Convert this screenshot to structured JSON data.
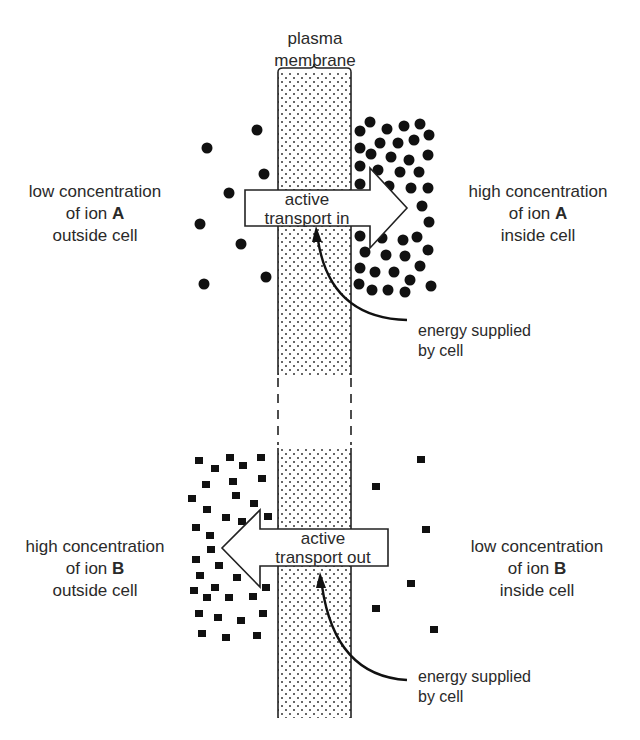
{
  "title": {
    "line1": "plasma",
    "line2": "membrane"
  },
  "top": {
    "left_label": {
      "line1": "low concentration",
      "line2_prefix": "of ion ",
      "ion": "A",
      "line3": "outside cell"
    },
    "right_label": {
      "line1": "high concentration",
      "line2_prefix": "of ion ",
      "ion": "A",
      "line3": "inside cell"
    },
    "arrow": {
      "line1": "active",
      "line2": "transport in",
      "direction": "right"
    },
    "energy": {
      "line1": "energy supplied",
      "line2": "by cell"
    },
    "particle_shape": "circle"
  },
  "bottom": {
    "left_label": {
      "line1": "high concentration",
      "line2_prefix": "of ion ",
      "ion": "B",
      "line3": "outside cell"
    },
    "right_label": {
      "line1": "low concentration",
      "line2_prefix": "of ion ",
      "ion": "B",
      "line3": "inside cell"
    },
    "arrow": {
      "line1": "active",
      "line2": "transport out",
      "direction": "left"
    },
    "energy": {
      "line1": "energy supplied",
      "line2": "by cell"
    },
    "particle_shape": "square"
  },
  "colors": {
    "ink": "#1a1a1a",
    "background": "#ffffff"
  }
}
